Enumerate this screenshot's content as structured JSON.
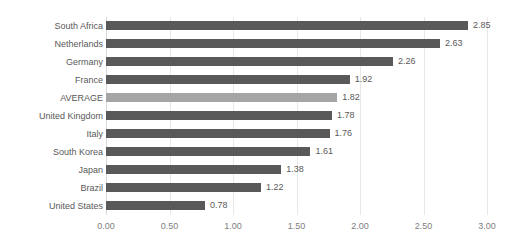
{
  "chart_data": {
    "type": "bar",
    "orientation": "horizontal",
    "title": "",
    "subtitle": "",
    "xlabel": "",
    "ylabel": "",
    "xlim": [
      0.0,
      3.0
    ],
    "xticks": [
      "0.00",
      "0.50",
      "1.00",
      "1.50",
      "2.00",
      "2.50",
      "3.00"
    ],
    "xtick_values": [
      0.0,
      0.5,
      1.0,
      1.5,
      2.0,
      2.5,
      3.0
    ],
    "grid": "vertical",
    "legend": "none",
    "categories": [
      "South Africa",
      "Netherlands",
      "Germany",
      "France",
      "AVERAGE",
      "United Kingdom",
      "Italy",
      "South Korea",
      "Japan",
      "Brazil",
      "United States"
    ],
    "values": [
      2.85,
      2.63,
      2.26,
      1.92,
      1.82,
      1.78,
      1.76,
      1.61,
      1.38,
      1.22,
      0.78
    ],
    "data_labels": [
      "2.85",
      "2.63",
      "2.26",
      "1.92",
      "1.82",
      "1.78",
      "1.76",
      "1.61",
      "1.38",
      "1.22",
      "0.78"
    ],
    "highlight_index": 4,
    "colors": {
      "bar": "#595959",
      "bar_highlight": "#a5a5a5",
      "label_text": "#595959",
      "tick_text": "#808080",
      "gridline": "#e8e8e8",
      "axis": "#d9d9d9",
      "background": "#ffffff"
    }
  }
}
